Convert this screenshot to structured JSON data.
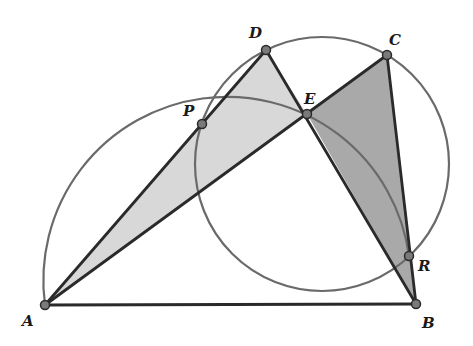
{
  "diagram": {
    "type": "geometry",
    "colors": {
      "background": "#ffffff",
      "stroke": "#2a2a2a",
      "circle": "#6a6a6a",
      "light_fill": "#d8d8d8",
      "dark_fill": "#a9a9a9",
      "point_fill": "#7a7a7a"
    },
    "points": {
      "A": {
        "label": "A",
        "x": 45,
        "y": 305
      },
      "B": {
        "label": "B",
        "x": 416,
        "y": 304
      },
      "C": {
        "label": "C",
        "x": 387,
        "y": 55
      },
      "D": {
        "label": "D",
        "x": 266,
        "y": 50
      },
      "E": {
        "label": "E",
        "x": 307,
        "y": 114
      },
      "P": {
        "label": "P",
        "x": 202,
        "y": 124
      },
      "R": {
        "label": "R",
        "x": 409,
        "y": 256
      }
    },
    "segments": [
      "AB",
      "AD",
      "AC",
      "DB",
      "CB"
    ],
    "shaded_triangles": [
      {
        "vertices": "ADE",
        "shade": "light"
      },
      {
        "vertices": "ECB",
        "shade": "dark"
      }
    ],
    "circles": [
      {
        "name": "circle-DCR",
        "cx": 322,
        "cy": 164,
        "r": 127,
        "through": [
          "D",
          "C",
          "R",
          "P"
        ]
      },
      {
        "name": "arc-APR",
        "cx": 228,
        "cy": 305,
        "r": 183,
        "from": "A",
        "to": "R",
        "through": [
          "P"
        ]
      }
    ]
  }
}
